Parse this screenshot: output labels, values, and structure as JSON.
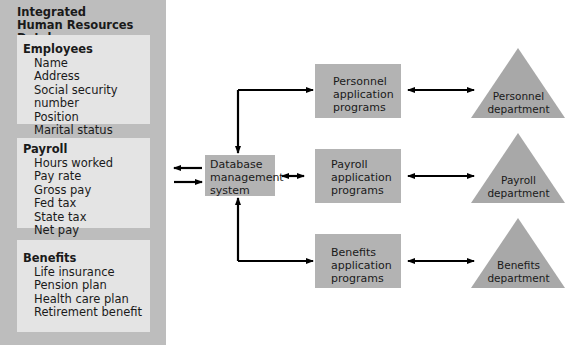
{
  "database": {
    "title_line1": "Integrated",
    "title_line2": "Human Resources Database",
    "sections": [
      {
        "title": "Employees",
        "fields": [
          "Name",
          "Address",
          "Social security number",
          "Position",
          "Marital status"
        ]
      },
      {
        "title": "Payroll",
        "fields": [
          "Hours worked",
          "Pay rate",
          "Gross pay",
          "Fed tax",
          "State tax",
          "Net pay"
        ]
      },
      {
        "title": "Benefits",
        "fields": [
          "Life insurance",
          "Pension plan",
          "Health care plan",
          "Retirement benefit"
        ]
      }
    ]
  },
  "dbms": {
    "line1": "Database",
    "line2": "management",
    "line3": "system"
  },
  "programs": [
    {
      "line1": "Personnel",
      "line2": "application",
      "line3": "programs"
    },
    {
      "line1": "Payroll",
      "line2": "application",
      "line3": "programs"
    },
    {
      "line1": "Benefits",
      "line2": "application",
      "line3": "programs"
    }
  ],
  "departments": [
    {
      "line1": "Personnel",
      "line2": "department"
    },
    {
      "line1": "Payroll",
      "line2": "department"
    },
    {
      "line1": "Benefits",
      "line2": "department"
    }
  ],
  "colors": {
    "panel": "#bdbdbd",
    "section": "#e4e4e4",
    "box": "#b3b3b3",
    "triangle": "#a8a8a8",
    "arrow": "#000000"
  }
}
